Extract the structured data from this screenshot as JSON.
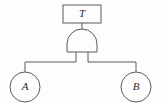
{
  "diagram": {
    "type": "fault-tree",
    "title": "",
    "background_color": "#fdfdfd",
    "stroke_color": "#5a5a5a",
    "label_color": "#2b2b2b",
    "top_event": {
      "label": "T",
      "shape": "rectangle",
      "x": 63,
      "y": 5,
      "width": 38,
      "height": 18
    },
    "gate": {
      "label": "",
      "kind": "AND",
      "shape": "and-gate",
      "center_x": 82,
      "top_y": 36,
      "bottom_y": 52,
      "width": 30,
      "input_stub_x": [
        76,
        88
      ]
    },
    "bus": {
      "y": 62,
      "left_x": 25,
      "right_x": 136
    },
    "basic_events": [
      {
        "label": "A",
        "shape": "circle",
        "cx": 25,
        "cy": 87,
        "r": 15
      },
      {
        "label": "B",
        "shape": "circle",
        "cx": 136,
        "cy": 87,
        "r": 15
      }
    ]
  }
}
